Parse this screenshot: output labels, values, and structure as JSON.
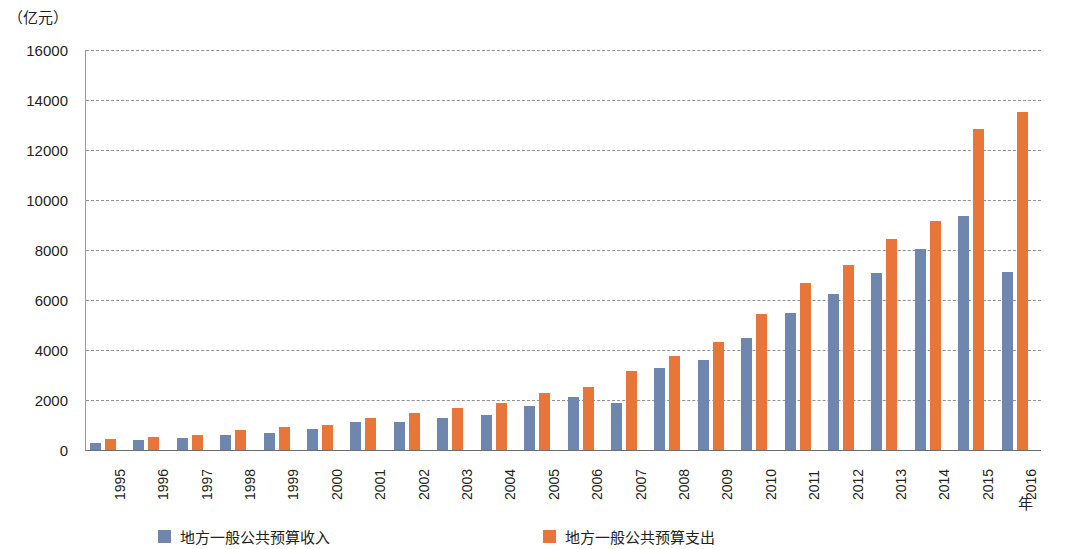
{
  "chart_data": {
    "type": "bar",
    "title": "",
    "unit_caption": "（亿元）",
    "ylabel": "亿元",
    "xlabel": "年",
    "ylim": [
      0,
      16000
    ],
    "ystep": 2000,
    "ytick_labels": [
      "16000",
      "14000",
      "12000",
      "10000",
      "8000",
      "6000",
      "4000",
      "2000",
      "0"
    ],
    "yticks": [
      16000,
      14000,
      12000,
      10000,
      8000,
      6000,
      4000,
      2000,
      0
    ],
    "grid": true,
    "legend_position": "bottom",
    "categories": [
      "1995",
      "1996",
      "1997",
      "1998",
      "1999",
      "2000",
      "2001",
      "2002",
      "2003",
      "2004",
      "2005",
      "2006",
      "2007",
      "2008",
      "2009",
      "2010",
      "2011",
      "2012",
      "2013",
      "2014",
      "2015",
      "2016"
    ],
    "series": [
      {
        "name": "地方一般公共预算收入",
        "color": "#6f86ae",
        "values": [
          300,
          420,
          470,
          590,
          700,
          860,
          1130,
          1140,
          1280,
          1420,
          1780,
          2130,
          1880,
          3270,
          3620,
          4500,
          5500,
          6230,
          7080,
          8040,
          9360,
          7140
        ]
      },
      {
        "name": "地方一般公共预算支出",
        "color": "#e8763a",
        "values": [
          440,
          540,
          620,
          800,
          930,
          1020,
          1290,
          1470,
          1690,
          1880,
          2270,
          2530,
          3160,
          3760,
          4340,
          5430,
          6700,
          7400,
          8430,
          9180,
          12830,
          13510
        ]
      }
    ]
  },
  "legend": {
    "items": [
      {
        "label": "地方一般公共预算收入",
        "color": "#6f86ae"
      },
      {
        "label": "地方一般公共预算支出",
        "color": "#e8763a"
      }
    ]
  },
  "axis": {
    "unit_caption": "（亿元）",
    "x_title": "年"
  }
}
